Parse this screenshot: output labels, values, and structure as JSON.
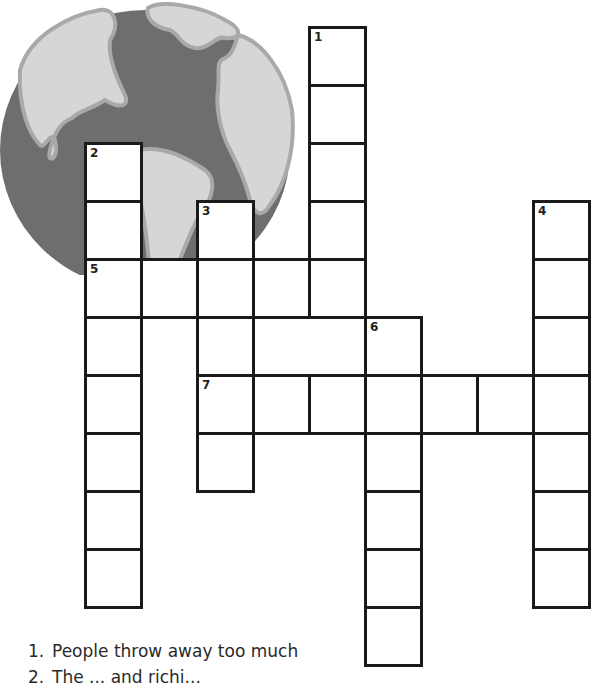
{
  "puzzle": {
    "type": "crossword",
    "colors": {
      "ocean": "#6e6e6e",
      "land": "#d6d6d6",
      "land_outline": "#a9a9a9",
      "grid_line": "#1a1a1a"
    },
    "grid": {
      "cell_width": 56,
      "cell_height": 58,
      "origin_x": 85,
      "origin_y": 27,
      "entries": [
        {
          "number": "1",
          "direction": "down",
          "col": 4,
          "row": 0,
          "length": 5
        },
        {
          "number": "2",
          "direction": "down",
          "col": 0,
          "row": 2,
          "length": 8
        },
        {
          "number": "3",
          "direction": "down",
          "col": 2,
          "row": 3,
          "length": 5
        },
        {
          "number": "4",
          "direction": "down",
          "col": 8,
          "row": 3,
          "length": 7
        },
        {
          "number": "5",
          "direction": "across",
          "col": 0,
          "row": 4,
          "length": 5
        },
        {
          "number": "6",
          "direction": "down",
          "col": 5,
          "row": 5,
          "length": 6
        },
        {
          "number": "7",
          "direction": "across",
          "col": 2,
          "row": 6,
          "length": 7
        }
      ]
    },
    "clues": [
      {
        "number": "1.",
        "text": "People throw away too much"
      },
      {
        "number": "2.",
        "text": "The ... and richi..."
      }
    ]
  }
}
